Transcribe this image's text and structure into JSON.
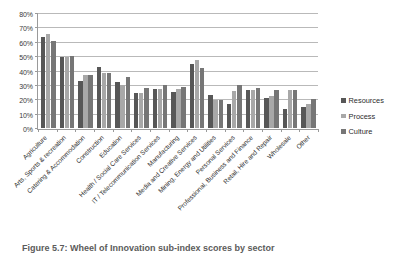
{
  "chart_data": {
    "type": "bar",
    "title": "",
    "xlabel": "",
    "ylabel": "",
    "ylim": [
      0,
      80
    ],
    "ytick_labels": [
      "0%",
      "10%",
      "20%",
      "30%",
      "40%",
      "50%",
      "60%",
      "70%",
      "80%"
    ],
    "ytick_values": [
      0,
      10,
      20,
      30,
      40,
      50,
      60,
      70,
      80
    ],
    "grid": true,
    "legend_position": "right",
    "categories": [
      "Agriculture",
      "Arts, Sports & recreation",
      "Catering & Accommodation",
      "Construction",
      "Education",
      "Health / Social Care Services",
      "IT / Telecommunication Services",
      "Manufacturing",
      "Media and Creative Services",
      "Mining, Energy and Utilities",
      "Personal Services",
      "Professional, Business and Finance",
      "Retail, Hire and Repair",
      "Wholesale",
      "Other"
    ],
    "series": [
      {
        "name": "Resources",
        "color": "#575757",
        "values": [
          64,
          50,
          33,
          42.5,
          32.5,
          24.5,
          27.5,
          25,
          45,
          23,
          17,
          27,
          21,
          13,
          15
        ]
      },
      {
        "name": "Process",
        "color": "#a8a8a8",
        "values": [
          66,
          50,
          37,
          38.5,
          30.5,
          24.5,
          27.5,
          27.5,
          48,
          19.5,
          26,
          27,
          22.5,
          27,
          17
        ]
      },
      {
        "name": "Culture",
        "color": "#767676",
        "values": [
          61,
          50.5,
          37.5,
          38.5,
          35.5,
          28,
          30,
          29,
          42,
          20,
          30,
          28,
          26.5,
          27,
          20.5
        ]
      }
    ]
  },
  "legend": {
    "items": [
      {
        "label": "Resources"
      },
      {
        "label": "Process"
      },
      {
        "label": "Culture"
      }
    ]
  },
  "caption": {
    "text": "Figure 5.7: Wheel of Innovation sub-index scores by sector"
  }
}
